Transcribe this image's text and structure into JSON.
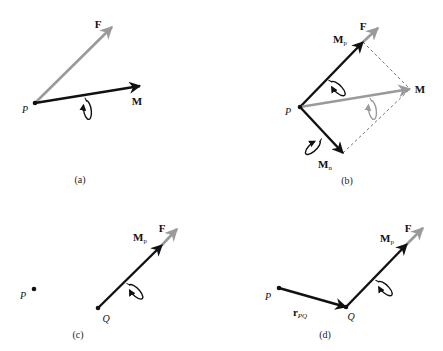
{
  "colors": {
    "black_vector": "#111111",
    "gray_vector": "#9a9a9a",
    "dashed": "#555555"
  },
  "panels": [
    {
      "id": "a",
      "caption": "(a)",
      "caption_pos": [
        80,
        180
      ],
      "points": [
        {
          "name": "P",
          "x": 35,
          "y": 103,
          "label_pos": [
            25,
            110
          ]
        }
      ],
      "vectors": [
        {
          "name": "F",
          "from": [
            35,
            103
          ],
          "to": [
            112,
            27
          ],
          "color": "gray",
          "label": "F",
          "label_pos": [
            98,
            24
          ]
        },
        {
          "name": "M",
          "from": [
            35,
            103
          ],
          "to": [
            140,
            86
          ],
          "color": "black",
          "label": "M",
          "label_pos": [
            137,
            101
          ]
        }
      ],
      "curls": [
        {
          "on": "M",
          "cx": 83,
          "cy": 96,
          "color": "black"
        }
      ]
    },
    {
      "id": "b",
      "caption": "(b)",
      "caption_pos": [
        347,
        181
      ],
      "points": [
        {
          "name": "P",
          "x": 300,
          "y": 107,
          "label_pos": [
            288,
            112
          ]
        }
      ],
      "vectors": [
        {
          "name": "F",
          "from": [
            363,
            42
          ],
          "to": [
            378,
            28
          ],
          "color": "gray",
          "label": "F",
          "label_pos": [
            363,
            26
          ]
        },
        {
          "name": "Mp",
          "from": [
            300,
            107
          ],
          "to": [
            363,
            42
          ],
          "color": "black",
          "label": "M",
          "sub": "p",
          "label_pos": [
            340,
            40
          ]
        },
        {
          "name": "M",
          "from": [
            300,
            107
          ],
          "to": [
            410,
            89
          ],
          "color": "gray",
          "label": "M",
          "label_pos": [
            420,
            89
          ]
        },
        {
          "name": "Mn",
          "from": [
            300,
            107
          ],
          "to": [
            343,
            153
          ],
          "color": "black",
          "label": "M",
          "sub": "n",
          "label_pos": [
            325,
            165
          ]
        }
      ],
      "dashed_lines": [
        {
          "from": [
            363,
            42
          ],
          "to": [
            410,
            89
          ]
        },
        {
          "from": [
            343,
            153
          ],
          "to": [
            410,
            89
          ]
        }
      ],
      "curls": [
        {
          "on": "Mp",
          "cx": 326,
          "cy": 80,
          "color": "black"
        },
        {
          "on": "Mn",
          "cx": 322,
          "cy": 136,
          "color": "black"
        },
        {
          "on": "M",
          "cx": 368,
          "cy": 96,
          "color": "gray"
        }
      ]
    },
    {
      "id": "c",
      "caption": "(c)",
      "caption_pos": [
        78,
        335
      ],
      "points": [
        {
          "name": "P",
          "x": 34,
          "y": 289,
          "label_pos": [
            23,
            296
          ]
        },
        {
          "name": "Q",
          "x": 98,
          "y": 308,
          "label_pos": [
            106,
            319
          ]
        }
      ],
      "vectors": [
        {
          "name": "F",
          "from": [
            162,
            245
          ],
          "to": [
            177,
            229
          ],
          "color": "gray",
          "label": "F",
          "label_pos": [
            162,
            228
          ]
        },
        {
          "name": "Mp",
          "from": [
            98,
            308
          ],
          "to": [
            162,
            245
          ],
          "color": "black",
          "label": "M",
          "sub": "p",
          "label_pos": [
            140,
            238
          ]
        }
      ],
      "curls": [
        {
          "on": "Mp",
          "cx": 124,
          "cy": 283,
          "color": "black"
        }
      ]
    },
    {
      "id": "d",
      "caption": "(d)",
      "caption_pos": [
        325,
        335
      ],
      "points": [
        {
          "name": "P",
          "x": 279,
          "y": 288,
          "label_pos": [
            268,
            297
          ]
        },
        {
          "name": "Q",
          "x": 346,
          "y": 307,
          "label_pos": [
            351,
            317
          ]
        }
      ],
      "vectors": [
        {
          "name": "rPQ",
          "from": [
            279,
            288
          ],
          "to": [
            346,
            307
          ],
          "color": "black",
          "label": "r",
          "sub": "PQ",
          "sub_italic": true,
          "label_pos": [
            300,
            313
          ]
        },
        {
          "name": "F",
          "from": [
            407,
            244
          ],
          "to": [
            423,
            228
          ],
          "color": "gray",
          "label": "F",
          "label_pos": [
            408,
            228
          ]
        },
        {
          "name": "Mp",
          "from": [
            346,
            307
          ],
          "to": [
            407,
            244
          ],
          "color": "black",
          "label": "M",
          "sub": "p",
          "label_pos": [
            387,
            239
          ]
        }
      ],
      "curls": [
        {
          "on": "Mp",
          "cx": 373,
          "cy": 280,
          "color": "black"
        }
      ]
    }
  ]
}
